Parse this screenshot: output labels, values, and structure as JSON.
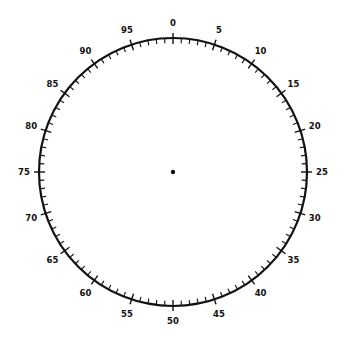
{
  "dial": {
    "center": [
      173,
      172
    ],
    "radius": 134,
    "divisions": 100,
    "major_every": 5,
    "minor_tick_length": 5,
    "major_tick_in": 6,
    "major_tick_out": 5,
    "label_offset": 15,
    "stroke_color": "#111111",
    "center_dot_radius": 2.2,
    "labels": [
      "0",
      "5",
      "10",
      "15",
      "20",
      "25",
      "30",
      "35",
      "40",
      "45",
      "50",
      "55",
      "60",
      "65",
      "70",
      "75",
      "80",
      "85",
      "90",
      "95"
    ]
  }
}
